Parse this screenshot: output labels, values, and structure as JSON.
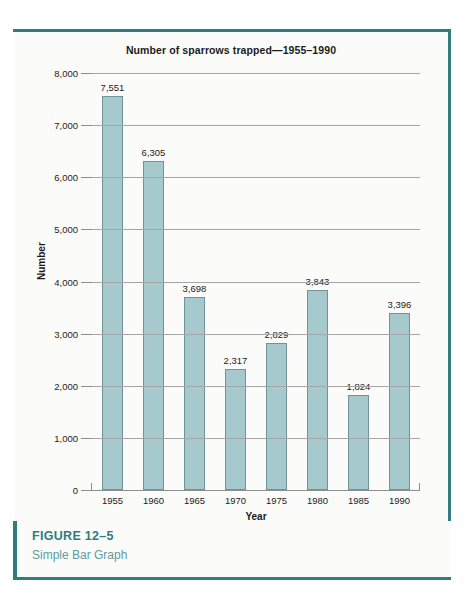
{
  "figure": {
    "label": "FIGURE 12–5",
    "caption": "Simple Bar Graph"
  },
  "colors": {
    "frame": "#2f7c81",
    "bar_fill": "#a6c9cd",
    "bar_stroke": "#6f9498",
    "gridline": "#a6a6a6",
    "caption_title": "#2f7c81",
    "caption_sub": "#5b9ca0",
    "background": "#fbfbf9"
  },
  "chart_data": {
    "type": "bar",
    "title": "Number of sparrows trapped—1955–1990",
    "xlabel": "Year",
    "ylabel": "Number",
    "categories": [
      "1955",
      "1960",
      "1965",
      "1970",
      "1975",
      "1980",
      "1985",
      "1990"
    ],
    "values": [
      7551,
      6305,
      3698,
      2317,
      2829,
      3843,
      1824,
      3396
    ],
    "value_labels": [
      "7,551",
      "6,305",
      "3,698",
      "2,317",
      "2,829",
      "3,843",
      "1,824",
      "3,396"
    ],
    "ylim": [
      0,
      8000
    ],
    "ytick_values": [
      0,
      1000,
      2000,
      3000,
      4000,
      5000,
      6000,
      7000,
      8000
    ],
    "ytick_labels": [
      "0",
      "1,000",
      "2,000",
      "3,000",
      "4,000",
      "5,000",
      "6,000",
      "7,000",
      "8,000"
    ],
    "grid": true,
    "grid_axis": "y",
    "legend": false,
    "legend_position": "none",
    "bar_count": 8
  }
}
